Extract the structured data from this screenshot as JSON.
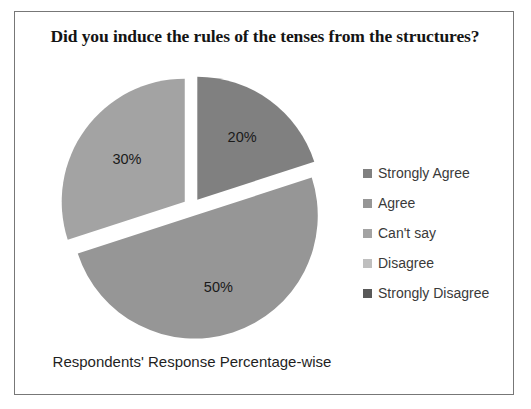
{
  "chart_data": {
    "type": "pie",
    "title": "Did you induce the rules of the tenses from the structures?",
    "xlabel": "Respondents' Response Percentage-wise",
    "ylabel": "",
    "categories": [
      "Strongly Agree",
      "Agree",
      "Can't say",
      "Disagree",
      "Strongly Disagree"
    ],
    "values": [
      20,
      50,
      30,
      0,
      0
    ],
    "data_labels": [
      "20%",
      "50%",
      "30%",
      "0%",
      "0%"
    ],
    "colors": [
      "#808080",
      "#969696",
      "#a3a3a3",
      "#bfbfbf",
      "#595959"
    ],
    "legend_position": "right",
    "exploded": true,
    "start_angle_deg": 0,
    "grid": false
  },
  "frame": {
    "border_color": "#777777",
    "background": "#ffffff"
  },
  "zero_labels": {
    "combined": "0% 0%"
  },
  "legend": {
    "items": [
      {
        "label": "Strongly Agree",
        "color": "#808080"
      },
      {
        "label": "Agree",
        "color": "#969696"
      },
      {
        "label": "Can't say",
        "color": "#a3a3a3"
      },
      {
        "label": "Disagree",
        "color": "#bfbfbf"
      },
      {
        "label": "Strongly Disagree",
        "color": "#595959"
      }
    ]
  }
}
